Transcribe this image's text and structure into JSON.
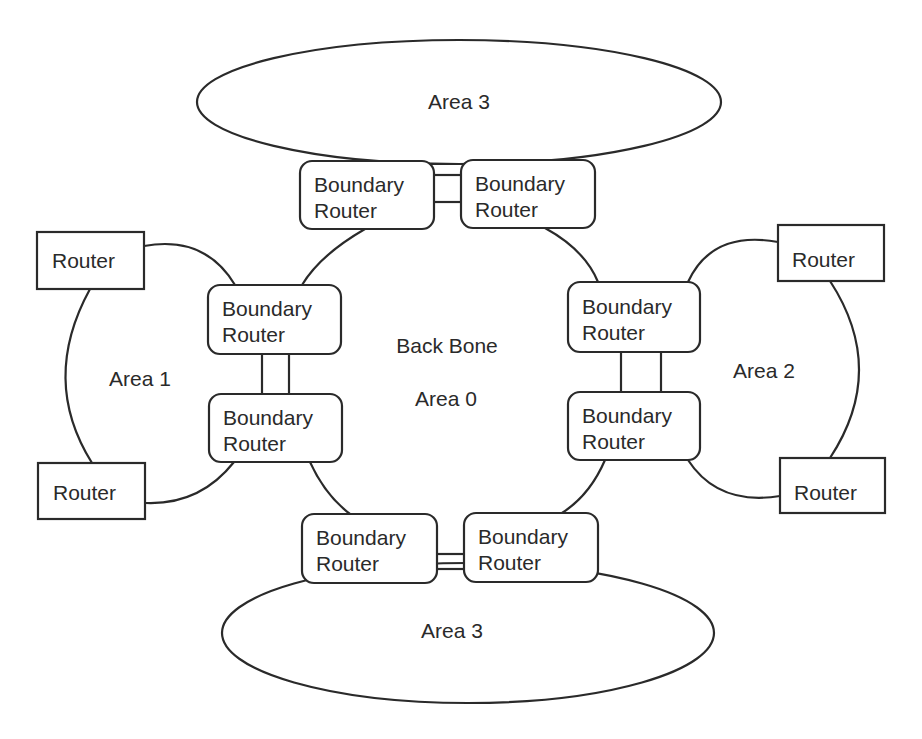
{
  "diagram": {
    "type": "ospf-area-topology",
    "areas": {
      "top": "Area 3",
      "bottom": "Area 3",
      "left": "Area 1",
      "right": "Area 2",
      "center_line1": "Back Bone",
      "center_line2": "Area 0"
    },
    "boundary_router": {
      "line1": "Boundary",
      "line2": "Router"
    },
    "router": {
      "label": "Router"
    },
    "colors": {
      "stroke": "#2a2a2a",
      "background": "#ffffff",
      "text": "#2a2a2a"
    }
  }
}
